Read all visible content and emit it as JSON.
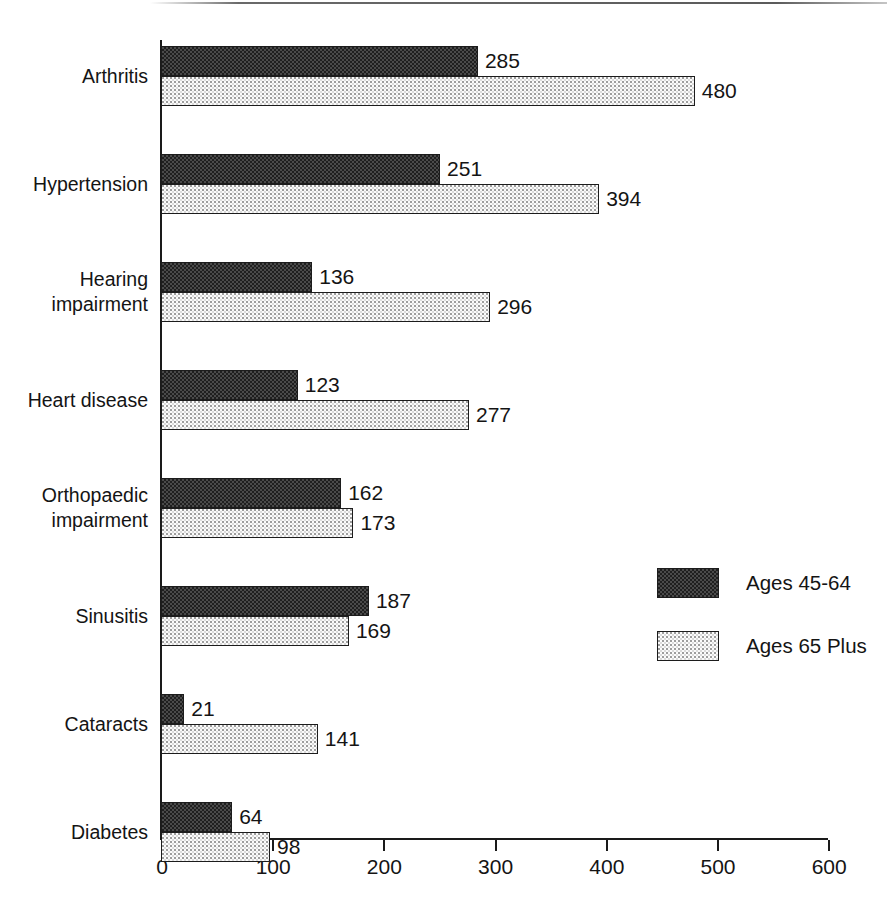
{
  "chart_data": {
    "type": "bar",
    "orientation": "horizontal",
    "title": "",
    "subtitle": "",
    "xlabel": "",
    "ylabel": "",
    "xlim": [
      0,
      600
    ],
    "xticks": [
      0,
      100,
      200,
      300,
      400,
      500,
      600
    ],
    "xtick_labels": [
      "0",
      "100",
      "200",
      "300",
      "400",
      "500",
      "600"
    ],
    "grid": false,
    "legend_position": "center-right",
    "categories": [
      "Arthritis",
      "Hypertension",
      "Hearing\nimpairment",
      "Heart disease",
      "Orthopaedic\nimpairment",
      "Sinusitis",
      "Cataracts",
      "Diabetes",
      "Visual\nimpairment",
      "Tinnitus"
    ],
    "series": [
      {
        "name": "Ages 45-64",
        "pattern": "dark-checkerboard",
        "color": "#3a3a3a",
        "values": [
          285,
          251,
          136,
          123,
          162,
          187,
          21,
          64,
          46,
          49
        ]
      },
      {
        "name": "Ages 65 Plus",
        "pattern": "light-stipple",
        "color": "#f2f2f2",
        "values": [
          480,
          394,
          296,
          277,
          173,
          169,
          141,
          98,
          95,
          85
        ]
      }
    ]
  },
  "legend": {
    "items": [
      {
        "label": "Ages 45-64"
      },
      {
        "label": "Ages 65 Plus"
      }
    ]
  },
  "axis": {
    "line_color": "#1a1a1a"
  }
}
